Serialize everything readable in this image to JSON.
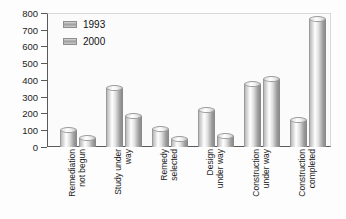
{
  "chart_data": {
    "type": "bar",
    "title": "",
    "subtitle": "",
    "xlabel": "",
    "ylabel": "",
    "ylim": [
      0,
      800
    ],
    "yticks": [
      0,
      100,
      200,
      300,
      400,
      500,
      600,
      700,
      800
    ],
    "grid": false,
    "legend_position": "top-left",
    "categories": [
      "Remediation\nnot begun",
      "Study under\nway",
      "Remedy\nselected",
      "Design\nunder way",
      "Construction\nunder way",
      "Construction\ncompleted"
    ],
    "series": [
      {
        "name": "1993",
        "values": [
          100,
          355,
          110,
          220,
          375,
          160
        ]
      },
      {
        "name": "2000",
        "values": [
          55,
          185,
          50,
          65,
          405,
          765
        ]
      }
    ]
  },
  "legend": {
    "items": [
      {
        "label": "1993",
        "swatch": "legend-swatch-1993"
      },
      {
        "label": "2000",
        "swatch": "legend-swatch-2000"
      }
    ]
  },
  "axis": {
    "y_tick_labels": [
      "800",
      "700",
      "600",
      "500",
      "400",
      "300",
      "200",
      "100",
      "0"
    ]
  },
  "colors": {
    "bar_light": "#ffffff",
    "bar_mid": "#c9c9c9",
    "bar_dark": "#8c8c8c",
    "axis": "#5a5a5a",
    "text": "#1c1c1c",
    "plot_background": "#fbfbfb"
  }
}
